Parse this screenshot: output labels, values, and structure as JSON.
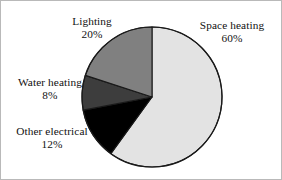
{
  "chart_data": {
    "type": "pie",
    "title": "",
    "subtitle": "",
    "xlabel": "",
    "ylabel": "",
    "legend_position": "none",
    "labels_position": "outside",
    "grid": false,
    "units": "percent",
    "start_angle_deg": 0,
    "direction": "clockwise",
    "categories": [
      "Space heating",
      "Other electrical",
      "Water heating",
      "Lighting"
    ],
    "values": [
      60,
      12,
      8,
      20
    ],
    "value_labels": [
      "60%",
      "12%",
      "8%",
      "20%"
    ],
    "colors": [
      "#e3e3e3",
      "#000000",
      "#3d3d3d",
      "#808080"
    ],
    "slices": [
      {
        "name": "Space heating",
        "value": 60,
        "value_label": "60%",
        "color": "#e3e3e3",
        "start_deg": 0,
        "end_deg": 216
      },
      {
        "name": "Other electrical",
        "value": 12,
        "value_label": "12%",
        "color": "#000000",
        "start_deg": 216,
        "end_deg": 259.2
      },
      {
        "name": "Water heating",
        "value": 8,
        "value_label": "8%",
        "color": "#3d3d3d",
        "start_deg": 259.2,
        "end_deg": 288
      },
      {
        "name": "Lighting",
        "value": 20,
        "value_label": "20%",
        "color": "#808080",
        "start_deg": 288,
        "end_deg": 360
      }
    ]
  },
  "labels": {
    "space_heating": {
      "name": "Space heating",
      "value": "60%"
    },
    "lighting": {
      "name": "Lighting",
      "value": "20%"
    },
    "water_heating": {
      "name": "Water heating",
      "value": "8%"
    },
    "other_electrical": {
      "name": "Other electrical",
      "value": "12%"
    }
  },
  "style": {
    "outline_color": "#1a1a1a",
    "frame_color": "#b9b9b9",
    "background": "#ffffff",
    "text_color": "#111111"
  }
}
